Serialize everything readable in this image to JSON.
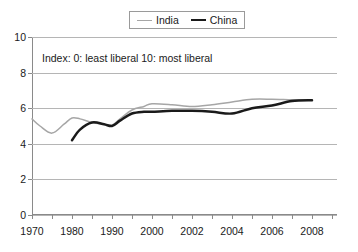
{
  "chart_data": {
    "type": "line",
    "title": "",
    "subtitle": "",
    "xlabel": "",
    "ylabel": "",
    "annotation": "Index: 0: least liberal 10: most liberal",
    "grid": true,
    "legend_position": "top-center",
    "xlim": [
      1970,
      2008
    ],
    "ylim": [
      0,
      10
    ],
    "y_ticks": [
      0,
      2,
      4,
      6,
      8,
      10
    ],
    "y_tick_labels": [
      "0",
      "2",
      "4",
      "6",
      "8",
      "10"
    ],
    "x_tick_labels": [
      "1970",
      "1980",
      "1990",
      "2000",
      "2002",
      "2004",
      "2006",
      "2008"
    ],
    "x_axis_positions": [
      0,
      40,
      80,
      120,
      160,
      200,
      240,
      280
    ],
    "x_minor_tick_count": 15,
    "series": [
      {
        "name": "India",
        "color": "#a6a6a6",
        "stroke_width": 1.5,
        "x": [
          1970,
          1972,
          1975,
          1978,
          1980,
          1982,
          1985,
          1988,
          1990,
          1992,
          1995,
          1998,
          2000,
          2001,
          2002,
          2003,
          2004,
          2005,
          2006,
          2007,
          2008
        ],
        "values": [
          5.4,
          5.0,
          4.6,
          5.1,
          5.45,
          5.4,
          5.2,
          5.1,
          5.05,
          5.4,
          5.9,
          6.1,
          6.25,
          6.2,
          6.1,
          6.2,
          6.35,
          6.5,
          6.5,
          6.47,
          6.45
        ]
      },
      {
        "name": "China",
        "color": "#1a1a1a",
        "stroke_width": 2.5,
        "x": [
          1980,
          1982,
          1985,
          1988,
          1990,
          1992,
          1995,
          1998,
          2000,
          2001,
          2002,
          2003,
          2004,
          2005,
          2006,
          2007,
          2008
        ],
        "values": [
          4.2,
          4.8,
          5.2,
          5.1,
          5.0,
          5.3,
          5.7,
          5.8,
          5.8,
          5.85,
          5.85,
          5.8,
          5.7,
          6.0,
          6.15,
          6.4,
          6.45
        ]
      }
    ]
  },
  "legend": {
    "items": [
      {
        "label": "India"
      },
      {
        "label": "China"
      }
    ]
  }
}
